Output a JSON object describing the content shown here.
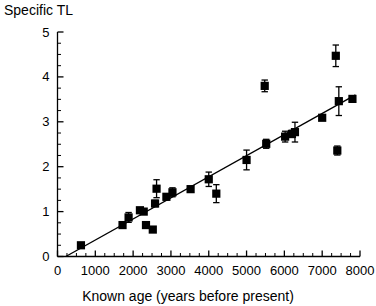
{
  "chart_data": {
    "type": "scatter",
    "title": "",
    "xlabel": "Known age (years before present)",
    "ylabel": "Specific TL",
    "xlim": [
      0,
      8000
    ],
    "ylim": [
      0,
      5
    ],
    "xticks": [
      0,
      1000,
      2000,
      3000,
      4000,
      5000,
      6000,
      7000,
      8000
    ],
    "xticklabels": [
      "0",
      "1000",
      "2000",
      "3000",
      "4000",
      "5000",
      "6000",
      "7000",
      "8000"
    ],
    "yticks": [
      0,
      1,
      2,
      3,
      4,
      5
    ],
    "yticklabels": [
      "0",
      "1",
      "2",
      "3",
      "4",
      "5"
    ],
    "x_minor_tick_step": 250,
    "y_minor_tick_step": 0.25,
    "grid": false,
    "legend": null,
    "marker": "square",
    "marker_color": "#000000",
    "points": [
      {
        "x": 620,
        "y": 0.25,
        "yerr": 0.0
      },
      {
        "x": 1720,
        "y": 0.7,
        "yerr": 0.05
      },
      {
        "x": 1880,
        "y": 0.87,
        "yerr": 0.11
      },
      {
        "x": 2180,
        "y": 1.03,
        "yerr": 0.06
      },
      {
        "x": 2280,
        "y": 1.0,
        "yerr": 0.05
      },
      {
        "x": 2340,
        "y": 0.7,
        "yerr": 0.0
      },
      {
        "x": 2520,
        "y": 0.6,
        "yerr": 0.06
      },
      {
        "x": 2580,
        "y": 1.18,
        "yerr": 0.07
      },
      {
        "x": 2620,
        "y": 1.51,
        "yerr": 0.2
      },
      {
        "x": 2880,
        "y": 1.33,
        "yerr": 0.07
      },
      {
        "x": 3040,
        "y": 1.43,
        "yerr": 0.1
      },
      {
        "x": 3520,
        "y": 1.5,
        "yerr": 0.06
      },
      {
        "x": 4000,
        "y": 1.72,
        "yerr": 0.16
      },
      {
        "x": 4200,
        "y": 1.4,
        "yerr": 0.2
      },
      {
        "x": 5000,
        "y": 2.15,
        "yerr": 0.22
      },
      {
        "x": 5480,
        "y": 3.8,
        "yerr": 0.13
      },
      {
        "x": 5520,
        "y": 2.51,
        "yerr": 0.1
      },
      {
        "x": 6020,
        "y": 2.67,
        "yerr": 0.12
      },
      {
        "x": 6200,
        "y": 2.73,
        "yerr": 0.08
      },
      {
        "x": 6280,
        "y": 2.77,
        "yerr": 0.22
      },
      {
        "x": 7000,
        "y": 3.09,
        "yerr": 0.05
      },
      {
        "x": 7360,
        "y": 4.47,
        "yerr": 0.24
      },
      {
        "x": 7400,
        "y": 2.36,
        "yerr": 0.1
      },
      {
        "x": 7440,
        "y": 3.46,
        "yerr": 0.32
      },
      {
        "x": 7800,
        "y": 3.51,
        "yerr": 0.0
      }
    ],
    "fit_line": {
      "type": "linear",
      "x_start": 220,
      "y_start": 0.0,
      "x_end": 7880,
      "y_end": 3.6
    }
  }
}
